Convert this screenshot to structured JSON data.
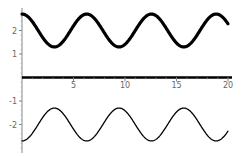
{
  "chart_data": {
    "type": "line",
    "title": "",
    "xlabel": "",
    "ylabel": "",
    "xlim": [
      0,
      20
    ],
    "ylim": [
      -3,
      3
    ],
    "grid": false,
    "legend": null,
    "x_ticks": [
      5,
      10,
      15,
      20
    ],
    "x_tick_labels": [
      "5",
      "10",
      "15",
      "20"
    ],
    "y_ticks": [
      2,
      1,
      -1,
      -2
    ],
    "y_tick_labels": [
      "2",
      "1",
      "-1",
      "-2"
    ],
    "series": [
      {
        "name": "top curve",
        "formula": "2 + 0.7*cos(x)",
        "style": "thick",
        "color": "#000000",
        "x": [
          0,
          1.57,
          3.14,
          4.71,
          6.28,
          7.85,
          9.42,
          11.0,
          12.57,
          14.14,
          15.71,
          17.28,
          18.85,
          20
        ],
        "y": [
          2.7,
          2.0,
          1.3,
          2.0,
          2.7,
          2.0,
          1.3,
          2.0,
          2.7,
          2.0,
          1.3,
          2.0,
          2.7,
          2.29
        ]
      },
      {
        "name": "bottom curve",
        "formula": "-2 - 0.7*cos(x)",
        "style": "thin",
        "color": "#000000",
        "x": [
          0,
          1.57,
          3.14,
          4.71,
          6.28,
          7.85,
          9.42,
          11.0,
          12.57,
          14.14,
          15.71,
          17.28,
          18.85,
          20
        ],
        "y": [
          -2.7,
          -2.0,
          -1.3,
          -2.0,
          -2.7,
          -2.0,
          -1.3,
          -2.0,
          -2.7,
          -2.0,
          -1.3,
          -2.0,
          -2.7,
          -2.29
        ]
      }
    ]
  },
  "plot": {
    "origin_px": [
      22,
      77.5
    ],
    "x_scale_px": 10.3,
    "y_scale_px": 23.5
  }
}
